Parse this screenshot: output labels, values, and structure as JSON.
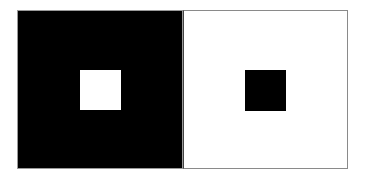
{
  "figure": {
    "description": "Simultaneous brightness contrast illusion",
    "left_panel": {
      "background_color": "#000000",
      "inner_square_color": "#ffffff"
    },
    "right_panel": {
      "background_color": "#ffffff",
      "inner_square_color": "#000000",
      "border_color": "#8a8a8a"
    }
  }
}
